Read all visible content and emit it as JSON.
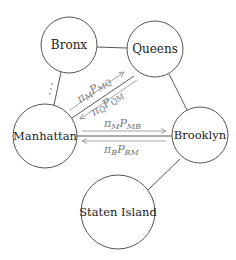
{
  "diagram": {
    "type": "markov-chain-network",
    "nodes": [
      {
        "id": "bronx",
        "label": "Bronx",
        "cx": 69,
        "cy": 45,
        "r": 28
      },
      {
        "id": "queens",
        "label": "Queens",
        "cx": 155,
        "cy": 49,
        "r": 28
      },
      {
        "id": "manhattan",
        "label": "Manhattan",
        "cx": 45,
        "cy": 136,
        "r": 32
      },
      {
        "id": "brooklyn",
        "label": "Brooklyn",
        "cx": 200,
        "cy": 135,
        "r": 28
      },
      {
        "id": "staten_island",
        "label": "Staten Island",
        "cx": 118,
        "cy": 212,
        "r": 37
      }
    ],
    "edges": [
      {
        "from": "bronx",
        "to": "queens"
      },
      {
        "from": "bronx",
        "to": "manhattan",
        "annotation": "⋮"
      },
      {
        "from": "manhattan",
        "to": "queens"
      },
      {
        "from": "manhattan",
        "to": "brooklyn"
      },
      {
        "from": "queens",
        "to": "brooklyn"
      },
      {
        "from": "brooklyn",
        "to": "staten_island"
      }
    ],
    "flows": [
      {
        "from": "manhattan",
        "to": "queens",
        "label": {
          "pi": "π",
          "pi_sub": "M",
          "p": "P",
          "p_sub": "MQ"
        }
      },
      {
        "from": "queens",
        "to": "manhattan",
        "label": {
          "pi": "π",
          "pi_sub": "Q",
          "p": "P",
          "p_sub": "QM"
        }
      },
      {
        "from": "manhattan",
        "to": "brooklyn",
        "label": {
          "pi": "π",
          "pi_sub": "M",
          "p": "P",
          "p_sub": "MB"
        }
      },
      {
        "from": "brooklyn",
        "to": "manhattan",
        "label": {
          "pi": "π",
          "pi_sub": "B",
          "p": "P",
          "p_sub": "BM"
        }
      }
    ],
    "colors": {
      "node_stroke": "#555555",
      "edge": "#444444",
      "flow_arrow": "#9a9a9a",
      "flow_label": "#777777"
    }
  }
}
